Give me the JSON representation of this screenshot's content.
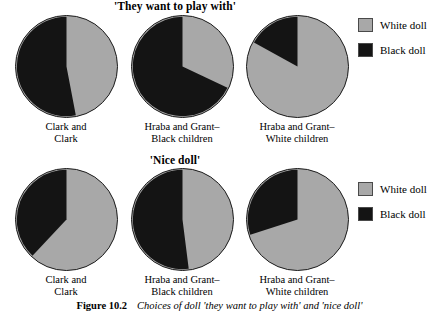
{
  "figure": {
    "caption_label": "Figure 10.2",
    "caption_text": "Choices of doll 'they want to play with' and 'nice doll'"
  },
  "colors": {
    "white_doll": "#a8a8a8",
    "black_doll": "#141414",
    "outline": "#1a1a1a",
    "background": "#ffffff"
  },
  "legend": {
    "white_doll_label": "White doll",
    "black_doll_label": "Black doll"
  },
  "panels": [
    {
      "title": "'They want to play with'",
      "groups": [
        "Clark and\nClark",
        "Hraba and Grant–\nBlack children",
        "Hraba and Grant–\nWhite children"
      ]
    },
    {
      "title": "'Nice doll'",
      "groups": [
        "Clark and\nClark",
        "Hraba and Grant–\nBlack children",
        "Hraba and Grant–\nWhite children"
      ]
    }
  ],
  "chart_data": {
    "type": "pie",
    "title": "Choices of doll 'they want to play with' and 'nice doll'",
    "legend": [
      "White doll",
      "Black doll"
    ],
    "legend_position": "right",
    "series_colors": {
      "White doll": "#a8a8a8",
      "Black doll": "#141414"
    },
    "units": "percent",
    "panels": [
      {
        "title": "'They want to play with'",
        "pies": [
          {
            "group": "Clark and Clark",
            "labels": [
              "White doll",
              "Black doll"
            ],
            "values": [
              47,
              53
            ]
          },
          {
            "group": "Hraba and Grant–Black children",
            "labels": [
              "White doll",
              "Black doll"
            ],
            "values": [
              32,
              68
            ]
          },
          {
            "group": "Hraba and Grant–White children",
            "labels": [
              "White doll",
              "Black doll"
            ],
            "values": [
              83,
              17
            ]
          }
        ]
      },
      {
        "title": "'Nice doll'",
        "pies": [
          {
            "group": "Clark and Clark",
            "labels": [
              "White doll",
              "Black doll"
            ],
            "values": [
              62,
              38
            ]
          },
          {
            "group": "Hraba and Grant–Black children",
            "labels": [
              "White doll",
              "Black doll"
            ],
            "values": [
              48,
              52
            ]
          },
          {
            "group": "Hraba and Grant–White children",
            "labels": [
              "White doll",
              "Black doll"
            ],
            "values": [
              70,
              30
            ]
          }
        ]
      }
    ]
  }
}
